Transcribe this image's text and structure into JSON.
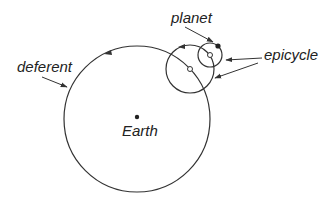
{
  "diagram": {
    "type": "ptolemaic-epicycle-model",
    "labels": {
      "planet": "planet",
      "epicycle": "epicycle",
      "deferent": "deferent",
      "earth": "Earth"
    },
    "colors": {
      "stroke": "#333333",
      "text": "#222222",
      "background": "#ffffff"
    },
    "elements": {
      "deferent_circle": {
        "cx": 137,
        "cy": 119,
        "r": 73
      },
      "large_epicycle": {
        "cx": 190,
        "cy": 69,
        "r": 24
      },
      "small_epicycle": {
        "cx": 210,
        "cy": 55,
        "r": 12
      },
      "earth_dot": {
        "cx": 137,
        "cy": 117
      },
      "planet_dot": {
        "cx": 218,
        "cy": 46
      }
    }
  }
}
